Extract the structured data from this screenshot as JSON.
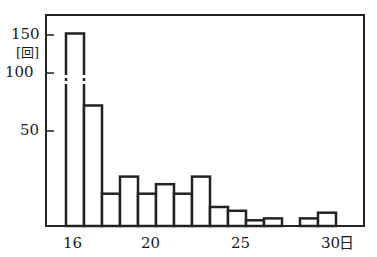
{
  "chart_data": {
    "type": "bar",
    "title": "",
    "xlabel": "日",
    "ylabel": "回",
    "categories": [
      "16",
      "17",
      "18",
      "19",
      "20",
      "21",
      "22",
      "23",
      "24",
      "25",
      "26",
      "27",
      "28",
      "29",
      "30"
    ],
    "values": [
      152,
      72,
      17,
      26,
      17,
      22,
      17,
      26,
      10,
      8,
      3,
      4,
      0,
      4,
      7
    ],
    "y_ticks": [
      50,
      100,
      150
    ],
    "x_tick_labels": [
      "16",
      "20",
      "25",
      "30"
    ],
    "axis_break": "between 50 and 100 on y-axis (broken bar at 16)",
    "grid": false,
    "legend": null
  },
  "axis": {
    "y_unit": "[回]",
    "x_unit": "日",
    "y150": "150",
    "y100": "100",
    "y50": "50",
    "x16": "16",
    "x20": "20",
    "x25": "25",
    "x30": "30"
  }
}
